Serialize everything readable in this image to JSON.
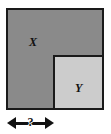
{
  "figure": {
    "outer_shape": {
      "label": "X",
      "fill_color": "#8a8a8a",
      "border_color": "#1a1a1a"
    },
    "inner_shape": {
      "label": "Y",
      "fill_color": "#cccccc",
      "border_color": "#1a1a1a"
    },
    "dimension": {
      "label": "?",
      "left_arrow_icon": "arrow-left-icon",
      "right_arrow_icon": "arrow-right-icon",
      "line_color": "#111111"
    },
    "background_color": "#ffffff"
  }
}
